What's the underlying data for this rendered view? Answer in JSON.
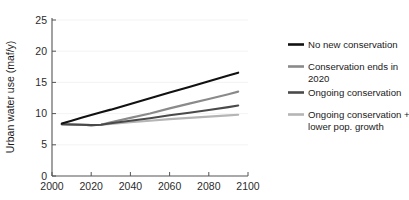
{
  "chart_data": {
    "type": "line",
    "title": "",
    "xlabel": "",
    "ylabel": "Urban water use (maf/y)",
    "xlim": [
      2000,
      2100
    ],
    "ylim": [
      0,
      25
    ],
    "grid": false,
    "legend_position": "right",
    "x_ticks": [
      "2000",
      "2020",
      "2040",
      "2060",
      "2080",
      "2100"
    ],
    "y_ticks": [
      "0",
      "5",
      "10",
      "15",
      "20",
      "25"
    ],
    "x": [
      2005,
      2010,
      2015,
      2020,
      2025,
      2030,
      2040,
      2050,
      2060,
      2070,
      2080,
      2090,
      2095
    ],
    "series": [
      {
        "name": "No new conservation",
        "color": "#111111",
        "values": [
          8.3,
          8.75,
          9.2,
          9.65,
          10.1,
          10.5,
          11.4,
          12.3,
          13.2,
          14.1,
          15.0,
          15.9,
          16.35
        ]
      },
      {
        "name": "Conservation ends in 2020",
        "color": "#8a8a8a",
        "values": [
          8.2,
          8.15,
          8.1,
          8.05,
          8.1,
          8.5,
          9.2,
          9.9,
          10.7,
          11.45,
          12.2,
          12.95,
          13.35
        ]
      },
      {
        "name": "Ongoing conservation",
        "color": "#4a4a4a",
        "values": [
          8.2,
          8.15,
          8.1,
          8.05,
          8.1,
          8.35,
          8.75,
          9.15,
          9.6,
          10.0,
          10.45,
          10.9,
          11.15
        ]
      },
      {
        "name": "Ongoing conservation + lower pop. growth",
        "color": "#b5b5b5",
        "values": [
          8.2,
          8.15,
          8.1,
          8.05,
          8.1,
          8.25,
          8.5,
          8.75,
          9.0,
          9.2,
          9.4,
          9.6,
          9.7
        ]
      }
    ]
  },
  "legend": {
    "entries": [
      {
        "label": "No new conservation",
        "line2": "",
        "color": "#111111"
      },
      {
        "label": "Conservation ends in",
        "line2": "2020",
        "color": "#8a8a8a"
      },
      {
        "label": "Ongoing conservation",
        "line2": "",
        "color": "#4a4a4a"
      },
      {
        "label": "Ongoing conservation +",
        "line2": "lower pop. growth",
        "color": "#b5b5b5"
      }
    ]
  },
  "axes": {
    "y_title": "Urban water use (maf/y)",
    "axis_color": "#555555"
  }
}
